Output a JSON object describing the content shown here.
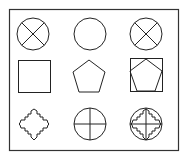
{
  "diagram": {
    "title": "",
    "stroke_color": "#222222",
    "background": "#ffffff",
    "grid": {
      "rows": 3,
      "cols": 3,
      "cells": [
        {
          "row": 1,
          "col": 1,
          "shape": "circle-with-x"
        },
        {
          "row": 1,
          "col": 2,
          "shape": "circle"
        },
        {
          "row": 1,
          "col": 3,
          "shape": "circle-with-x"
        },
        {
          "row": 2,
          "col": 1,
          "shape": "square"
        },
        {
          "row": 2,
          "col": 2,
          "shape": "pentagon"
        },
        {
          "row": 2,
          "col": 3,
          "shape": "square-with-inscribed-pentagon"
        },
        {
          "row": 3,
          "col": 1,
          "shape": "stepped-cross"
        },
        {
          "row": 3,
          "col": 2,
          "shape": "circle-with-plus"
        },
        {
          "row": 3,
          "col": 3,
          "shape": "circle-with-plus-and-stepped-cross"
        }
      ]
    }
  }
}
